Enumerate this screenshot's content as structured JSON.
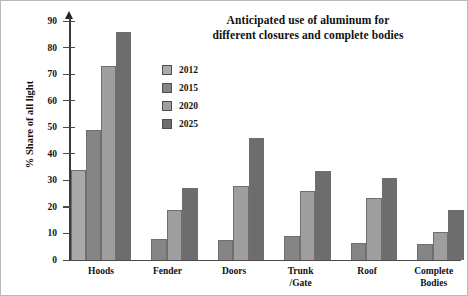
{
  "title": {
    "line1": "Anticipated use of aluminum for",
    "line2": "different closures and complete bodies"
  },
  "legend": {
    "position": "inside-top-center",
    "items": [
      {
        "label": "2012",
        "color": "#a9a9a9"
      },
      {
        "label": "2015",
        "color": "#858585"
      },
      {
        "label": "2020",
        "color": "#9e9e9e"
      },
      {
        "label": "2025",
        "color": "#6d6d6d"
      }
    ]
  },
  "axes": {
    "ylabel": "% Share of all light",
    "yticks": [
      "0",
      "10",
      "20",
      "30",
      "40",
      "50",
      "60",
      "70",
      "80",
      "90"
    ],
    "xlabel": ""
  },
  "chart_data": {
    "type": "bar",
    "title": "Anticipated use of aluminum for different closures and complete bodies",
    "xlabel": "",
    "ylabel": "% Share of all light",
    "ylim": [
      0,
      90
    ],
    "ytick_step": 10,
    "grid": false,
    "legend": "inside-top-center",
    "categories": [
      {
        "line1": "Hoods",
        "line2": ""
      },
      {
        "line1": "Fender",
        "line2": ""
      },
      {
        "line1": "Doors",
        "line2": ""
      },
      {
        "line1": "Trunk",
        "line2": "/Gate"
      },
      {
        "line1": "Roof",
        "line2": ""
      },
      {
        "line1": "Complete",
        "line2": "Bodies"
      }
    ],
    "series": [
      {
        "name": "2012",
        "color": "#a9a9a9",
        "values": [
          34,
          0,
          0,
          0,
          0,
          0
        ]
      },
      {
        "name": "2015",
        "color": "#858585",
        "values": [
          49,
          8,
          7.5,
          9,
          6.5,
          6
        ]
      },
      {
        "name": "2020",
        "color": "#9e9e9e",
        "values": [
          73,
          19,
          28,
          26,
          23.5,
          10.5
        ]
      },
      {
        "name": "2025",
        "color": "#6d6d6d",
        "values": [
          86,
          27,
          46,
          33.5,
          31,
          19
        ]
      }
    ]
  }
}
